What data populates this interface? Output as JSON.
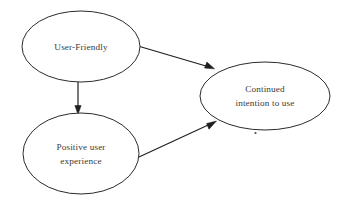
{
  "diagram": {
    "background_color": "#ffffff",
    "stroke_color": "#2b2b2b",
    "text_color": "#3a3a3a",
    "nodes": [
      {
        "id": "user-friendly",
        "label": "User-Friendly",
        "lines": [
          "User-Friendly"
        ],
        "shape": "ellipse",
        "cx": 81,
        "cy": 46.5,
        "rx": 59,
        "ry": 35.5
      },
      {
        "id": "positive-user-experience",
        "label": "Positive user experience",
        "lines": [
          "Positive user",
          "experience"
        ],
        "shape": "ellipse",
        "cx": 81,
        "cy": 153.5,
        "rx": 58,
        "ry": 40.5
      },
      {
        "id": "continued-intention-to-use",
        "label": "Continued intention to use",
        "lines": [
          "Continued",
          "intention to use"
        ],
        "shape": "ellipse",
        "cx": 265,
        "cy": 96,
        "rx": 65,
        "ry": 34
      }
    ],
    "edges": [
      {
        "id": "edge-userfriendly-to-continued",
        "from": "user-friendly",
        "to": "continued-intention-to-use",
        "label": "",
        "x1": 138,
        "y1": 46,
        "x2": 214,
        "y2": 68.5
      },
      {
        "id": "edge-userfriendly-to-positive",
        "from": "user-friendly",
        "to": "positive-user-experience",
        "label": "",
        "x1": 78,
        "y1": 82,
        "x2": 78,
        "y2": 113.5
      },
      {
        "id": "edge-positive-to-continued",
        "from": "positive-user-experience",
        "to": "continued-intention-to-use",
        "label": "",
        "x1": 139,
        "y1": 157,
        "x2": 216,
        "y2": 121
      }
    ],
    "marks": [
      {
        "id": "stray-dot",
        "type": "dot",
        "cx": 255.5,
        "cy": 133,
        "r": 1.1
      }
    ]
  }
}
